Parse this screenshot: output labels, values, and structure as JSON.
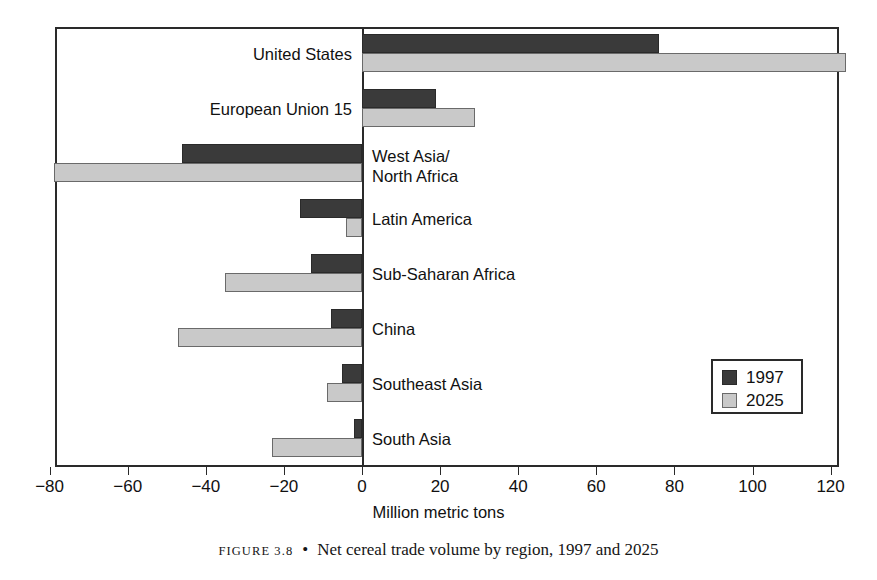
{
  "caption": {
    "figure_number": "FIGURE 3.8",
    "bullet": "•",
    "text": "Net cereal trade volume by region, 1997 and 2025"
  },
  "legend": {
    "position": "bottom-right-inside",
    "entries": [
      {
        "label": "1997",
        "color": "#3a3a3a"
      },
      {
        "label": "2025",
        "color": "#c9c9c9"
      }
    ]
  },
  "axis": {
    "title": "Million metric tons",
    "ticks": [
      "−80",
      "−60",
      "−40",
      "−20",
      "0",
      "20",
      "40",
      "60",
      "80",
      "100",
      "120"
    ]
  },
  "categories": [
    {
      "label": "United States"
    },
    {
      "label": "European Union 15"
    },
    {
      "label_line1": "West Asia/",
      "label_line2": "North Africa"
    },
    {
      "label": "Latin America"
    },
    {
      "label": "Sub-Saharan Africa"
    },
    {
      "label": "China"
    },
    {
      "label": "Southeast Asia"
    },
    {
      "label": "South Asia"
    }
  ],
  "chart_data": {
    "type": "bar",
    "orientation": "horizontal",
    "title": "Net cereal trade volume by region, 1997 and 2025",
    "xlabel": "Million metric tons",
    "ylabel": "",
    "xlim": [
      -80,
      120
    ],
    "xticks": [
      -80,
      -60,
      -40,
      -20,
      0,
      20,
      40,
      60,
      80,
      100,
      120
    ],
    "grid": false,
    "legend_position": "lower right",
    "categories": [
      "United States",
      "European Union 15",
      "West Asia/North Africa",
      "Latin America",
      "Sub-Saharan Africa",
      "China",
      "Southeast Asia",
      "South Asia"
    ],
    "series": [
      {
        "name": "1997",
        "color": "#3a3a3a",
        "values": [
          76,
          19,
          -46,
          -16,
          -13,
          -8,
          -5,
          -2
        ]
      },
      {
        "name": "2025",
        "color": "#c9c9c9",
        "values": [
          124,
          29,
          -79,
          -4,
          -35,
          -47,
          -9,
          -23
        ]
      }
    ]
  }
}
